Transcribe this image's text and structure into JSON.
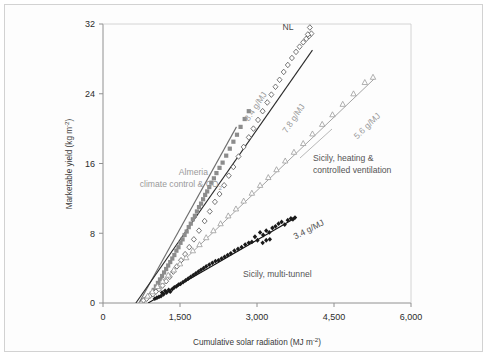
{
  "chart_data": {
    "type": "scatter",
    "title": "",
    "xlabel": "Cumulative solar radiation (MJ m-2)",
    "xlabel_main": "Cumulative solar radiation (MJ m",
    "xlabel_sup": "-2",
    "xlabel_tail": ")",
    "ylabel_main": "Marketable yield (kg m",
    "ylabel_sup": "-2",
    "ylabel_tail": ")",
    "xlim": [
      0,
      6000
    ],
    "ylim": [
      0,
      32
    ],
    "xticks": [
      0,
      1500,
      3000,
      4500,
      6000
    ],
    "xticklabels": [
      "0",
      "1,500",
      "3,000",
      "4,500",
      "6,000"
    ],
    "yticks": [
      0,
      8,
      16,
      24,
      32
    ],
    "yticklabels": [
      "0",
      "8",
      "16",
      "24",
      "32"
    ],
    "grid": false,
    "legend_position": "in-plot annotations",
    "series": [
      {
        "name": "Almeria climate control & CO2",
        "label": "Almeria",
        "label2_main": "climate control & CO",
        "label2_sub": "2",
        "slope_label": "8.4 g/MJ",
        "slope": 8.4,
        "marker": "filled-square",
        "color": "#8c8c8c",
        "line_color": "#6e6e6e",
        "fit_x": [
          700,
          2600
        ],
        "fit_y": [
          0,
          20.2
        ],
        "points": [
          [
            950,
            1.1
          ],
          [
            990,
            1.5
          ],
          [
            1030,
            1.9
          ],
          [
            1070,
            2.3
          ],
          [
            1110,
            2.7
          ],
          [
            1150,
            3.1
          ],
          [
            1190,
            3.5
          ],
          [
            1230,
            3.9
          ],
          [
            1270,
            4.3
          ],
          [
            1310,
            4.7
          ],
          [
            1350,
            5.1
          ],
          [
            1390,
            5.5
          ],
          [
            1430,
            6.0
          ],
          [
            1470,
            6.4
          ],
          [
            1510,
            6.9
          ],
          [
            1550,
            7.3
          ],
          [
            1590,
            7.8
          ],
          [
            1630,
            8.2
          ],
          [
            1670,
            8.7
          ],
          [
            1710,
            9.1
          ],
          [
            1750,
            9.6
          ],
          [
            1790,
            10.0
          ],
          [
            1830,
            10.5
          ],
          [
            1870,
            11.0
          ],
          [
            1910,
            11.4
          ],
          [
            1950,
            11.9
          ],
          [
            1990,
            12.4
          ],
          [
            2030,
            12.8
          ],
          [
            2070,
            13.3
          ],
          [
            2110,
            13.8
          ],
          [
            2160,
            14.3
          ],
          [
            2210,
            14.9
          ],
          [
            2270,
            15.5
          ],
          [
            2330,
            16.1
          ],
          [
            2400,
            16.9
          ],
          [
            2470,
            17.7
          ],
          [
            2540,
            18.5
          ],
          [
            2610,
            19.3
          ],
          [
            2680,
            20.2
          ],
          [
            2760,
            21.1
          ],
          [
            2840,
            22.0
          ]
        ]
      },
      {
        "name": "NL",
        "label": "NL",
        "slope_label": "7.8 g/MJ",
        "slope": 7.8,
        "marker": "open-diamond",
        "color": "#555555",
        "line_color": "#2b2b2b",
        "fit_x": [
          640,
          4080
        ],
        "fit_y": [
          0,
          29.0
        ],
        "points": [
          [
            790,
            0.3
          ],
          [
            850,
            0.5
          ],
          [
            910,
            0.8
          ],
          [
            970,
            1.0
          ],
          [
            1030,
            1.3
          ],
          [
            1090,
            1.6
          ],
          [
            1160,
            2.0
          ],
          [
            1230,
            2.5
          ],
          [
            1300,
            3.0
          ],
          [
            1370,
            3.6
          ],
          [
            1440,
            4.2
          ],
          [
            1520,
            4.9
          ],
          [
            1600,
            5.6
          ],
          [
            1680,
            6.4
          ],
          [
            1770,
            7.3
          ],
          [
            1870,
            8.3
          ],
          [
            1980,
            9.4
          ],
          [
            2080,
            10.5
          ],
          [
            2180,
            11.6
          ],
          [
            2270,
            12.5
          ],
          [
            2360,
            13.5
          ],
          [
            2450,
            14.6
          ],
          [
            2540,
            15.6
          ],
          [
            2640,
            16.8
          ],
          [
            2740,
            17.9
          ],
          [
            2840,
            19.0
          ],
          [
            2930,
            20.0
          ],
          [
            3020,
            21.0
          ],
          [
            3110,
            22.0
          ],
          [
            3200,
            23.0
          ],
          [
            3280,
            23.9
          ],
          [
            3360,
            24.8
          ],
          [
            3440,
            25.6
          ],
          [
            3520,
            26.5
          ],
          [
            3600,
            27.3
          ],
          [
            3680,
            28.1
          ],
          [
            3760,
            28.8
          ],
          [
            3830,
            29.4
          ],
          [
            3900,
            29.9
          ],
          [
            3960,
            30.3
          ],
          [
            4010,
            30.6
          ],
          [
            4060,
            30.9
          ],
          [
            4030,
            31.6
          ],
          [
            3990,
            30.8
          ]
        ]
      },
      {
        "name": "Sicily, heating & controlled ventilation",
        "label_line1": "Sicily, heating &",
        "label_line2": "controlled ventilation",
        "slope_label": "5.6 g/MJ",
        "slope": 5.6,
        "marker": "open-triangle",
        "color": "#9c9c9c",
        "line_color": "#9a9a9a",
        "fit_x": [
          700,
          5300
        ],
        "fit_y": [
          0,
          25.8
        ],
        "points": [
          [
            870,
            0.8
          ],
          [
            960,
            1.3
          ],
          [
            1060,
            1.9
          ],
          [
            1160,
            2.5
          ],
          [
            1270,
            3.2
          ],
          [
            1380,
            3.8
          ],
          [
            1500,
            4.5
          ],
          [
            1620,
            5.2
          ],
          [
            1750,
            6.0
          ],
          [
            1880,
            6.7
          ],
          [
            2010,
            7.5
          ],
          [
            2150,
            8.3
          ],
          [
            2290,
            9.1
          ],
          [
            2440,
            10.0
          ],
          [
            2590,
            10.8
          ],
          [
            2740,
            11.7
          ],
          [
            2900,
            12.6
          ],
          [
            3060,
            13.5
          ],
          [
            3220,
            14.4
          ],
          [
            3380,
            15.3
          ],
          [
            3550,
            16.3
          ],
          [
            3720,
            17.3
          ],
          [
            3900,
            18.3
          ],
          [
            4080,
            19.4
          ],
          [
            4270,
            20.5
          ],
          [
            4470,
            21.6
          ],
          [
            4670,
            22.8
          ],
          [
            4880,
            24.0
          ],
          [
            5100,
            25.3
          ],
          [
            5260,
            25.9
          ]
        ]
      },
      {
        "name": "Sicily, multi-tunnel",
        "label": "Sicily, multi-tunnel",
        "slope_label": "3.4 g/MJ",
        "slope": 3.4,
        "marker": "filled-diamond",
        "color": "#1a1a1a",
        "line_color": "#111111",
        "fit_x": [
          880,
          3760
        ],
        "fit_y": [
          0,
          9.8
        ],
        "points": [
          [
            1010,
            0.5
          ],
          [
            1050,
            0.6
          ],
          [
            1090,
            0.7
          ],
          [
            1130,
            0.8
          ],
          [
            1150,
            1.2
          ],
          [
            1180,
            1.0
          ],
          [
            1210,
            1.4
          ],
          [
            1240,
            1.2
          ],
          [
            1280,
            1.5
          ],
          [
            1310,
            1.3
          ],
          [
            1350,
            1.6
          ],
          [
            1390,
            1.8
          ],
          [
            1430,
            1.9
          ],
          [
            1470,
            2.1
          ],
          [
            1510,
            2.2
          ],
          [
            1560,
            2.4
          ],
          [
            1610,
            2.6
          ],
          [
            1660,
            2.8
          ],
          [
            1710,
            3.0
          ],
          [
            1760,
            3.2
          ],
          [
            1810,
            3.4
          ],
          [
            1860,
            3.6
          ],
          [
            1910,
            3.8
          ],
          [
            1960,
            4.0
          ],
          [
            2010,
            4.2
          ],
          [
            2070,
            4.4
          ],
          [
            2130,
            4.6
          ],
          [
            2190,
            4.8
          ],
          [
            2250,
            4.9
          ],
          [
            2310,
            5.1
          ],
          [
            2370,
            5.3
          ],
          [
            2430,
            5.5
          ],
          [
            2490,
            5.7
          ],
          [
            2560,
            6.0
          ],
          [
            2630,
            6.2
          ],
          [
            2700,
            6.4
          ],
          [
            2770,
            6.7
          ],
          [
            2840,
            6.9
          ],
          [
            2900,
            7.0
          ],
          [
            2960,
            7.6
          ],
          [
            3010,
            7.2
          ],
          [
            3060,
            8.1
          ],
          [
            3120,
            7.8
          ],
          [
            3180,
            8.3
          ],
          [
            3240,
            8.1
          ],
          [
            3300,
            8.6
          ],
          [
            3360,
            8.8
          ],
          [
            3420,
            9.1
          ],
          [
            3480,
            9.3
          ],
          [
            3540,
            9.0
          ],
          [
            3600,
            9.5
          ],
          [
            3660,
            9.7
          ],
          [
            3700,
            9.6
          ],
          [
            3740,
            9.8
          ],
          [
            3180,
            7.2
          ],
          [
            3250,
            7.3
          ],
          [
            3110,
            6.9
          ]
        ]
      }
    ]
  },
  "annotations": {
    "nl": "NL",
    "almeria_line1": "Almeria",
    "almeria_line2_main": "climate control & CO",
    "almeria_line2_sub": "2",
    "sicily_heating_line1": "Sicily, heating &",
    "sicily_heating_line2": "controlled ventilation",
    "sicily_multitunnel": "Sicily, multi-tunnel",
    "slope_84": "8.4 g/MJ",
    "slope_78": "7.8 g/MJ",
    "slope_56": "5.6 g/MJ",
    "slope_34": "3.4 g/MJ"
  },
  "colors": {
    "almeria": "#8c8c8c",
    "nl": "#2b2b2b",
    "sicily_heating": "#9a9a9a",
    "sicily_multitunnel": "#111111",
    "frame": "#d2d2d2",
    "axis": "#888888"
  }
}
